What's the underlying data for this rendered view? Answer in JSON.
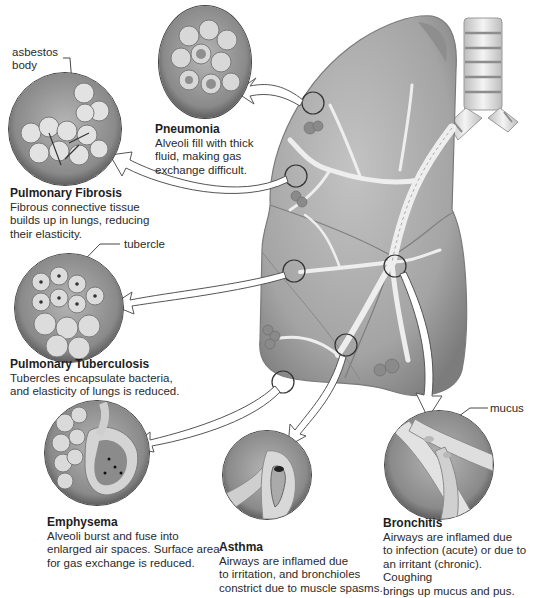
{
  "figure": {
    "colors": {
      "lung_fill": "#a9a9a9",
      "lung_shadow": "#7e7e7e",
      "airway": "#e6e6e6",
      "inset_bg": "#8c8c8c",
      "outline": "#3a3a3a",
      "text": "#222222"
    }
  },
  "labels": {
    "asbestos_body": "asbestos\nbody",
    "tubercle": "tubercle",
    "mucus": "mucus"
  },
  "diseases": [
    {
      "id": "pneumonia",
      "title": "Pneumonia",
      "description": "Alveoli fill with thick\nfluid, making gas\nexchange difficult."
    },
    {
      "id": "pulmonary-fibrosis",
      "title": "Pulmonary Fibrosis",
      "description": "Fibrous connective tissue\nbuilds up in lungs, reducing\ntheir elasticity."
    },
    {
      "id": "pulmonary-tuberculosis",
      "title": "Pulmonary Tuberculosis",
      "description": "Tubercles encapsulate bacteria,\nand elasticity of lungs is reduced."
    },
    {
      "id": "emphysema",
      "title": "Emphysema",
      "description": "Alveoli burst and fuse into\nenlarged air spaces. Surface area\nfor gas exchange is reduced."
    },
    {
      "id": "asthma",
      "title": "Asthma",
      "description": "Airways are inflamed due\nto irritation, and bronchioles\nconstrict due to muscle spasms."
    },
    {
      "id": "bronchitis",
      "title": "Bronchitis",
      "description": "Airways are inflamed due\nto infection (acute) or due to\nan irritant (chronic). Coughing\nbrings  up mucus and pus."
    }
  ]
}
